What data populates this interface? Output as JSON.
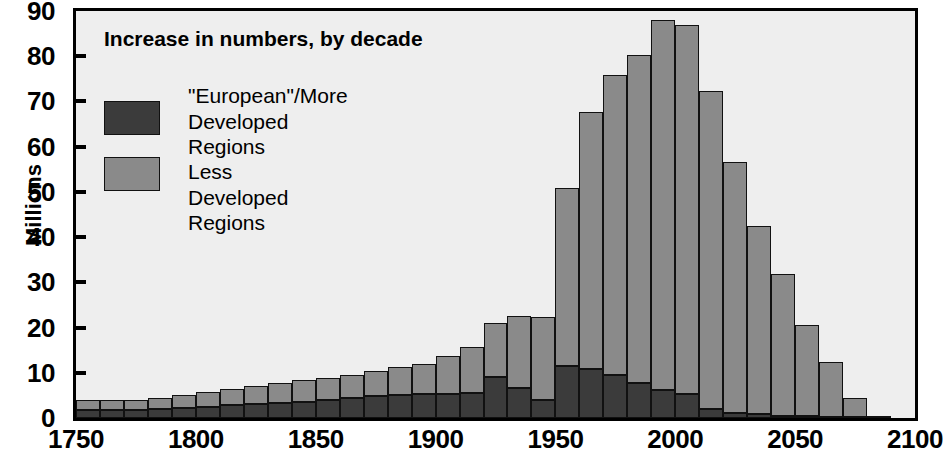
{
  "chart_data": {
    "type": "bar",
    "subtype": "stacked-bar-histogram",
    "title": "Increase in numbers, by decade",
    "xlabel": "",
    "ylabel": "Millions",
    "xlim": [
      1750,
      2100
    ],
    "ylim": [
      0,
      90
    ],
    "ytick_values": [
      0,
      10,
      20,
      30,
      40,
      50,
      60,
      70,
      80,
      90
    ],
    "xtick_values": [
      1750,
      1800,
      1850,
      1900,
      1950,
      2000,
      2050,
      2100
    ],
    "grid": false,
    "legend_position": "inside-top-left",
    "bar_width_years": 10,
    "categories": [
      1750,
      1760,
      1770,
      1780,
      1790,
      1800,
      1810,
      1820,
      1830,
      1840,
      1850,
      1860,
      1870,
      1880,
      1890,
      1900,
      1910,
      1920,
      1930,
      1940,
      1950,
      1960,
      1970,
      1980,
      1990,
      2000,
      2010,
      2020,
      2030,
      2040,
      2050,
      2060,
      2070,
      2080
    ],
    "series": [
      {
        "name": "\"European\"/More Developed Regions",
        "color": "#3b3b3b",
        "values": [
          1.8,
          1.8,
          1.8,
          2.0,
          2.2,
          2.5,
          2.8,
          3.0,
          3.3,
          3.6,
          4.0,
          4.4,
          4.8,
          5.2,
          5.3,
          5.4,
          5.6,
          9.0,
          6.7,
          4.0,
          11.6,
          10.8,
          9.6,
          7.7,
          6.1,
          5.4,
          2.0,
          1.2,
          0.8,
          0.5,
          0.4,
          0.3,
          0.3,
          0.3
        ]
      },
      {
        "name": "Less Developed Regions",
        "color": "#8a8a8a",
        "values": [
          2.1,
          2.1,
          2.2,
          2.4,
          2.8,
          3.2,
          3.7,
          4.0,
          4.4,
          4.7,
          4.9,
          5.2,
          5.6,
          6.0,
          6.7,
          8.3,
          10.1,
          12.0,
          15.9,
          18.3,
          39.2,
          56.9,
          66.3,
          72.5,
          82.0,
          81.6,
          70.4,
          55.4,
          41.6,
          31.4,
          20.2,
          12.0,
          4.2,
          0.0
        ]
      }
    ],
    "totals": [
      3.9,
      3.9,
      4.0,
      4.4,
      5.0,
      5.7,
      6.5,
      7.0,
      7.7,
      8.3,
      8.9,
      9.6,
      10.4,
      11.2,
      12.0,
      13.7,
      15.7,
      21.0,
      22.6,
      22.3,
      50.8,
      67.7,
      75.9,
      80.2,
      88.1,
      87.0,
      72.4,
      56.6,
      42.4,
      31.9,
      20.6,
      12.3,
      4.5,
      0.3
    ]
  },
  "legend": {
    "items": [
      {
        "label": "\"European\"/More\nDeveloped Regions",
        "series_index": 0
      },
      {
        "label": "Less Developed Regions",
        "series_index": 1
      }
    ]
  },
  "colors": {
    "more_developed": "#3b3b3b",
    "less_developed": "#8a8a8a",
    "plot_background": "#eeeeee",
    "axis": "#000000",
    "page_background": "#ffffff"
  }
}
